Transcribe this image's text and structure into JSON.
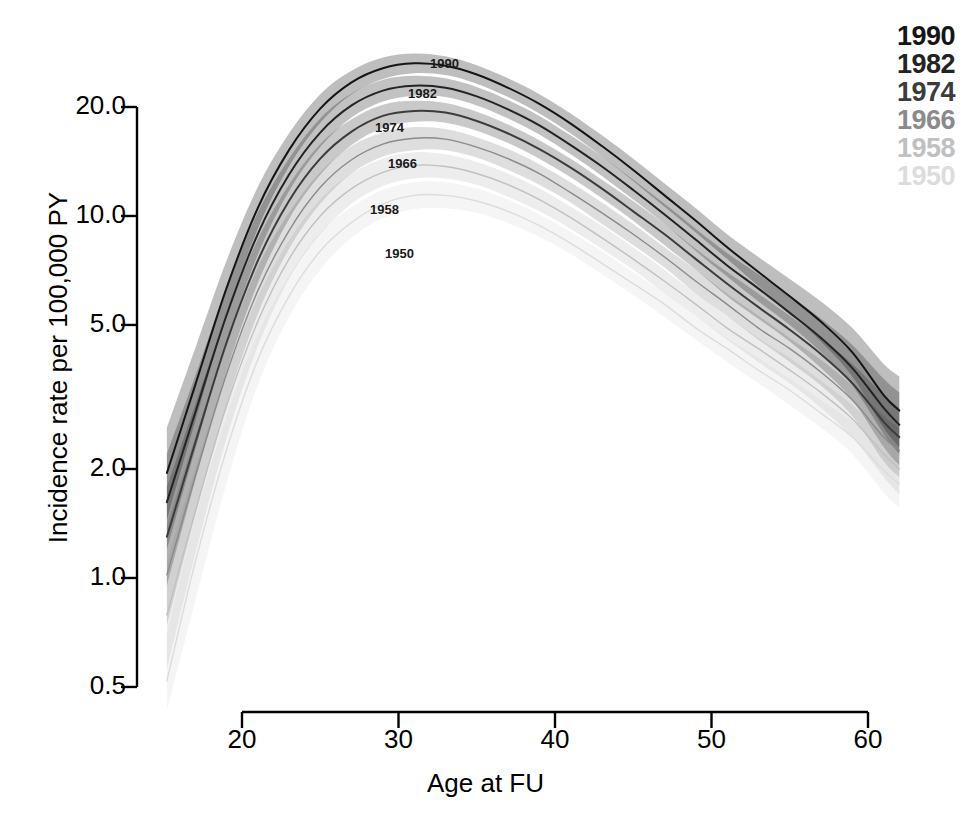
{
  "figure": {
    "background": "#ffffff",
    "line_color_dark": "#1a1a1a",
    "line_color_light": "#d8d8d8"
  },
  "axes": {
    "y_title": "Incidence rate per 100,000 PY",
    "x_title": "Age at FU",
    "y_ticks": [
      "20.0",
      "10.0",
      "5.0",
      "2.0",
      "1.0",
      "0.5"
    ],
    "x_ticks": [
      "20",
      "30",
      "40",
      "50",
      "60"
    ]
  },
  "legend": {
    "position": "top-right",
    "entries": [
      {
        "label": "1990",
        "color": "#151515"
      },
      {
        "label": "1982",
        "color": "#232323"
      },
      {
        "label": "1974",
        "color": "#3c3c3c"
      },
      {
        "label": "1966",
        "color": "#8a8a8a"
      },
      {
        "label": "1958",
        "color": "#c0c0c0"
      },
      {
        "label": "1950",
        "color": "#dcdcdc"
      }
    ]
  },
  "curve_labels": [
    {
      "label": "1990",
      "x": 430,
      "y": 56
    },
    {
      "label": "1982",
      "x": 408,
      "y": 86
    },
    {
      "label": "1974",
      "x": 375,
      "y": 120
    },
    {
      "label": "1966",
      "x": 388,
      "y": 156
    },
    {
      "label": "1958",
      "x": 370,
      "y": 202
    },
    {
      "label": "1950",
      "x": 385,
      "y": 246
    }
  ],
  "chart_data": {
    "type": "line",
    "title": "",
    "xlabel": "Age at FU",
    "ylabel": "Incidence rate per 100,000 PY",
    "yscale": "log",
    "xlim": [
      15.2,
      62.0
    ],
    "ylim": [
      0.42,
      30.0
    ],
    "ytick_values": [
      20.0,
      10.0,
      5.0,
      2.0,
      1.0,
      0.5
    ],
    "xtick_values": [
      20,
      30,
      40,
      50,
      60
    ],
    "grid": false,
    "legend_position": "upper right",
    "band_type": "confidence interval",
    "x": [
      15.2,
      17,
      19,
      21,
      23,
      25,
      27,
      29,
      31,
      33,
      35,
      37,
      39,
      41,
      43,
      45,
      47,
      49,
      51,
      53,
      55,
      57,
      59,
      61,
      62
    ],
    "series": [
      {
        "name": "1990",
        "color": "#151515",
        "values": [
          1.95,
          3.4,
          6.3,
          10.5,
          15.2,
          19.8,
          23.4,
          25.6,
          26.4,
          26.0,
          24.6,
          22.6,
          20.4,
          18.0,
          15.6,
          13.4,
          11.4,
          9.7,
          8.2,
          7.0,
          6.0,
          5.1,
          4.2,
          3.2,
          2.9
        ],
        "lower": [
          1.45,
          2.7,
          5.3,
          9.2,
          13.7,
          18.1,
          21.7,
          23.9,
          24.8,
          24.5,
          23.2,
          21.3,
          19.2,
          16.9,
          14.6,
          12.5,
          10.6,
          9.0,
          7.6,
          6.4,
          5.4,
          4.5,
          3.6,
          2.6,
          2.3
        ],
        "upper": [
          2.6,
          4.3,
          7.5,
          12.0,
          16.9,
          21.7,
          25.2,
          27.4,
          28.1,
          27.6,
          26.1,
          24.0,
          21.7,
          19.2,
          16.7,
          14.4,
          12.3,
          10.5,
          8.9,
          7.7,
          6.7,
          5.8,
          4.9,
          3.9,
          3.6
        ]
      },
      {
        "name": "1982",
        "color": "#232323",
        "values": [
          1.62,
          2.85,
          5.3,
          8.9,
          13.0,
          17.0,
          20.2,
          22.2,
          22.9,
          22.6,
          21.4,
          19.7,
          17.8,
          15.7,
          13.7,
          11.8,
          10.1,
          8.6,
          7.3,
          6.3,
          5.4,
          4.6,
          3.8,
          2.95,
          2.65
        ],
        "lower": [
          1.2,
          2.26,
          4.45,
          7.8,
          11.7,
          15.5,
          18.7,
          20.7,
          21.5,
          21.3,
          20.2,
          18.6,
          16.8,
          14.8,
          12.9,
          11.1,
          9.5,
          8.0,
          6.8,
          5.8,
          5.0,
          4.2,
          3.4,
          2.5,
          2.2
        ],
        "upper": [
          2.2,
          3.6,
          6.3,
          10.2,
          14.4,
          18.6,
          21.8,
          23.8,
          24.4,
          24.0,
          22.7,
          20.9,
          18.9,
          16.7,
          14.6,
          12.6,
          10.8,
          9.2,
          7.9,
          6.9,
          6.0,
          5.2,
          4.4,
          3.55,
          3.25
        ]
      },
      {
        "name": "1974",
        "color": "#3c3c3c",
        "values": [
          1.3,
          2.35,
          4.45,
          7.5,
          11.0,
          14.4,
          17.1,
          18.9,
          19.5,
          19.3,
          18.3,
          16.9,
          15.3,
          13.6,
          11.9,
          10.3,
          8.9,
          7.6,
          6.5,
          5.6,
          4.85,
          4.15,
          3.45,
          2.7,
          2.45
        ],
        "lower": [
          0.95,
          1.85,
          3.7,
          6.5,
          9.8,
          13.0,
          15.7,
          17.5,
          18.2,
          18.1,
          17.2,
          15.9,
          14.4,
          12.8,
          11.2,
          9.7,
          8.3,
          7.1,
          6.0,
          5.2,
          4.5,
          3.8,
          3.1,
          2.3,
          2.05
        ],
        "upper": [
          1.78,
          3.0,
          5.3,
          8.6,
          12.2,
          15.8,
          18.5,
          20.3,
          20.8,
          20.5,
          19.4,
          17.9,
          16.2,
          14.4,
          12.6,
          11.0,
          9.5,
          8.1,
          7.0,
          6.1,
          5.3,
          4.6,
          3.9,
          3.2,
          2.95
        ]
      },
      {
        "name": "1966",
        "color": "#8a8a8a",
        "values": [
          1.02,
          1.9,
          3.65,
          6.2,
          9.1,
          12.0,
          14.3,
          15.8,
          16.4,
          16.3,
          15.5,
          14.4,
          13.1,
          11.6,
          10.2,
          8.9,
          7.7,
          6.6,
          5.7,
          4.9,
          4.3,
          3.7,
          3.1,
          2.45,
          2.25
        ],
        "lower": [
          0.74,
          1.48,
          3.0,
          5.35,
          8.1,
          10.8,
          13.1,
          14.6,
          15.2,
          15.2,
          14.5,
          13.4,
          12.2,
          10.9,
          9.5,
          8.3,
          7.2,
          6.1,
          5.3,
          4.55,
          3.95,
          3.4,
          2.8,
          2.1,
          1.9
        ],
        "upper": [
          1.4,
          2.44,
          4.4,
          7.2,
          10.2,
          13.2,
          15.6,
          17.0,
          17.6,
          17.4,
          16.5,
          15.3,
          13.9,
          12.4,
          10.9,
          9.5,
          8.2,
          7.1,
          6.1,
          5.3,
          4.6,
          4.0,
          3.4,
          2.8,
          2.6
        ]
      },
      {
        "name": "1958",
        "color": "#c0c0c0",
        "values": [
          0.79,
          1.52,
          2.98,
          5.1,
          7.6,
          10.0,
          11.9,
          13.2,
          13.8,
          13.7,
          13.1,
          12.2,
          11.1,
          9.9,
          8.7,
          7.6,
          6.6,
          5.7,
          4.9,
          4.3,
          3.75,
          3.25,
          2.75,
          2.2,
          2.0
        ],
        "lower": [
          0.56,
          1.16,
          2.42,
          4.35,
          6.7,
          8.9,
          10.8,
          12.1,
          12.7,
          12.7,
          12.2,
          11.3,
          10.3,
          9.2,
          8.1,
          7.1,
          6.1,
          5.3,
          4.55,
          3.95,
          3.45,
          2.95,
          2.45,
          1.9,
          1.7
        ],
        "upper": [
          1.1,
          2.0,
          3.65,
          5.95,
          8.55,
          11.1,
          13.1,
          14.4,
          15.0,
          14.8,
          14.1,
          13.1,
          11.9,
          10.6,
          9.4,
          8.2,
          7.1,
          6.1,
          5.3,
          4.6,
          4.05,
          3.5,
          3.0,
          2.5,
          2.3
        ]
      },
      {
        "name": "1950",
        "color": "#dcdcdc",
        "values": [
          0.52,
          1.1,
          2.25,
          4.0,
          6.0,
          8.0,
          9.6,
          10.8,
          11.4,
          11.4,
          11.0,
          10.3,
          9.4,
          8.4,
          7.4,
          6.5,
          5.7,
          4.9,
          4.3,
          3.75,
          3.3,
          2.85,
          2.45,
          1.98,
          1.82
        ],
        "lower": [
          0.43,
          0.86,
          1.82,
          3.4,
          5.25,
          7.1,
          8.7,
          9.85,
          10.45,
          10.5,
          10.2,
          9.55,
          8.75,
          7.85,
          6.9,
          6.05,
          5.25,
          4.55,
          3.95,
          3.45,
          3.0,
          2.6,
          2.2,
          1.72,
          1.56
        ],
        "upper": [
          0.7,
          1.45,
          2.78,
          4.7,
          6.85,
          9.0,
          10.6,
          11.8,
          12.4,
          12.4,
          11.9,
          11.1,
          10.1,
          9.05,
          8.0,
          7.0,
          6.1,
          5.3,
          4.6,
          4.05,
          3.55,
          3.1,
          2.7,
          2.25,
          2.1
        ]
      }
    ]
  }
}
